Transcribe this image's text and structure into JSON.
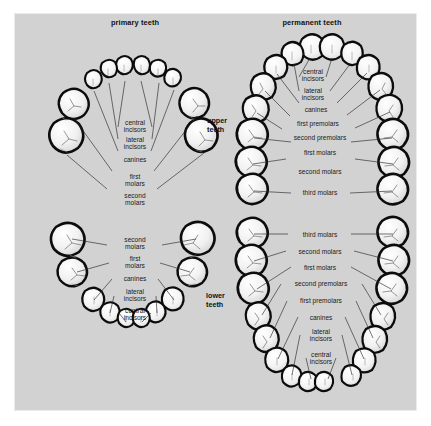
{
  "figure": {
    "background_color": "#d2d2d2",
    "page_background_color": "#ffffff",
    "tooth_fill_color": "#f4f4f4",
    "tooth_outline_color": "#0c0c0c",
    "text_color": "#1a1a1a"
  },
  "titles": {
    "primary": "primary teeth",
    "permanent": "permanent teeth"
  },
  "arch_labels": {
    "upper_line1": "upper",
    "upper_line2": "teeth",
    "lower_line1": "lower",
    "lower_line2": "teeth"
  },
  "quadrants": {
    "primary_upper": {
      "name": "primary upper arch",
      "tooth_count": 10,
      "labels": [
        {
          "id": "central-incisors",
          "line1": "central",
          "line2": "incisors"
        },
        {
          "id": "lateral-incisors",
          "line1": "lateral",
          "line2": "incisors"
        },
        {
          "id": "canines",
          "line1": "canines",
          "line2": ""
        },
        {
          "id": "first-molars",
          "line1": "first",
          "line2": "molars"
        },
        {
          "id": "second-molars",
          "line1": "second",
          "line2": "molars"
        }
      ]
    },
    "permanent_upper": {
      "name": "permanent upper arch",
      "tooth_count": 16,
      "labels": [
        {
          "id": "central-incisors",
          "line1": "central",
          "line2": "incisors"
        },
        {
          "id": "lateral-incisors",
          "line1": "lateral",
          "line2": "incisors"
        },
        {
          "id": "canines",
          "line1": "canines",
          "line2": ""
        },
        {
          "id": "first-premolars",
          "line1": "first premolars",
          "line2": ""
        },
        {
          "id": "second-premolars",
          "line1": "second premolars",
          "line2": ""
        },
        {
          "id": "first-molars",
          "line1": "first molars",
          "line2": ""
        },
        {
          "id": "second-molars",
          "line1": "second molars",
          "line2": ""
        },
        {
          "id": "third-molars",
          "line1": "third molars",
          "line2": ""
        }
      ]
    },
    "primary_lower": {
      "name": "primary lower arch",
      "tooth_count": 10,
      "labels": [
        {
          "id": "second-molars",
          "line1": "second",
          "line2": "molars"
        },
        {
          "id": "first-molars",
          "line1": "first",
          "line2": "molars"
        },
        {
          "id": "canines",
          "line1": "canines",
          "line2": ""
        },
        {
          "id": "lateral-incisors",
          "line1": "lateral",
          "line2": "incisors"
        },
        {
          "id": "central-incisors",
          "line1": "central",
          "line2": "incisors"
        }
      ]
    },
    "permanent_lower": {
      "name": "permanent lower arch",
      "tooth_count": 16,
      "labels": [
        {
          "id": "third-molars",
          "line1": "third molars",
          "line2": ""
        },
        {
          "id": "second-molars",
          "line1": "second molars",
          "line2": ""
        },
        {
          "id": "first-molars",
          "line1": "first molars",
          "line2": ""
        },
        {
          "id": "second-premolars",
          "line1": "second premolars",
          "line2": ""
        },
        {
          "id": "first-premolars",
          "line1": "first premolars",
          "line2": ""
        },
        {
          "id": "canines",
          "line1": "canines",
          "line2": ""
        },
        {
          "id": "lateral-incisors",
          "line1": "lateral",
          "line2": "incisors"
        },
        {
          "id": "central-incisors",
          "line1": "central",
          "line2": "incisors"
        }
      ]
    }
  }
}
